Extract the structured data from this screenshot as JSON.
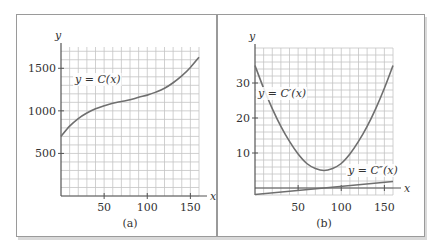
{
  "chart_data": [
    {
      "id": "a",
      "type": "line",
      "caption": "(a)",
      "xlabel": "x",
      "ylabel": "y",
      "xlim": [
        0,
        160
      ],
      "ylim": [
        0,
        1750
      ],
      "x_ticks": [
        50,
        100,
        150
      ],
      "y_ticks": [
        500,
        1000,
        1500
      ],
      "x_tick_labels": [
        "50",
        "100",
        "150"
      ],
      "y_tick_labels": [
        "500",
        "1000",
        "1500"
      ],
      "grid": true,
      "grid_step_x": 10,
      "grid_step_y": 100,
      "series": [
        {
          "name": "y = C(x)",
          "label": "y = C(x)",
          "x": [
            0,
            10,
            20,
            30,
            40,
            50,
            60,
            70,
            80,
            90,
            100,
            110,
            120,
            130,
            140,
            150,
            160
          ],
          "values": [
            700,
            820,
            910,
            975,
            1025,
            1060,
            1090,
            1110,
            1130,
            1160,
            1185,
            1220,
            1265,
            1330,
            1410,
            1510,
            1630
          ]
        }
      ]
    },
    {
      "id": "b",
      "type": "line",
      "caption": "(b)",
      "xlabel": "x",
      "ylabel": "y",
      "xlim": [
        0,
        160
      ],
      "ylim": [
        -2,
        40
      ],
      "x_ticks": [
        50,
        100,
        150
      ],
      "y_ticks": [
        10,
        20,
        30
      ],
      "x_tick_labels": [
        "50",
        "100",
        "150"
      ],
      "y_tick_labels": [
        "10",
        "20",
        "30"
      ],
      "grid": true,
      "grid_step_x": 10,
      "grid_step_y": 2,
      "series": [
        {
          "name": "y = C'(x)",
          "label": "y = C′(x)",
          "x": [
            0,
            10,
            20,
            30,
            40,
            50,
            60,
            70,
            80,
            90,
            100,
            110,
            120,
            130,
            140,
            150,
            160
          ],
          "values": [
            35,
            28.5,
            22.7,
            17.6,
            13.3,
            9.7,
            7.0,
            5.6,
            5.0,
            5.6,
            7.0,
            9.7,
            13.3,
            17.6,
            22.7,
            28.5,
            35
          ]
        },
        {
          "name": "y = C''(x)",
          "label": "y = C″(x)",
          "x": [
            0,
            160
          ],
          "values": [
            -1.875,
            1.875
          ]
        }
      ]
    }
  ]
}
